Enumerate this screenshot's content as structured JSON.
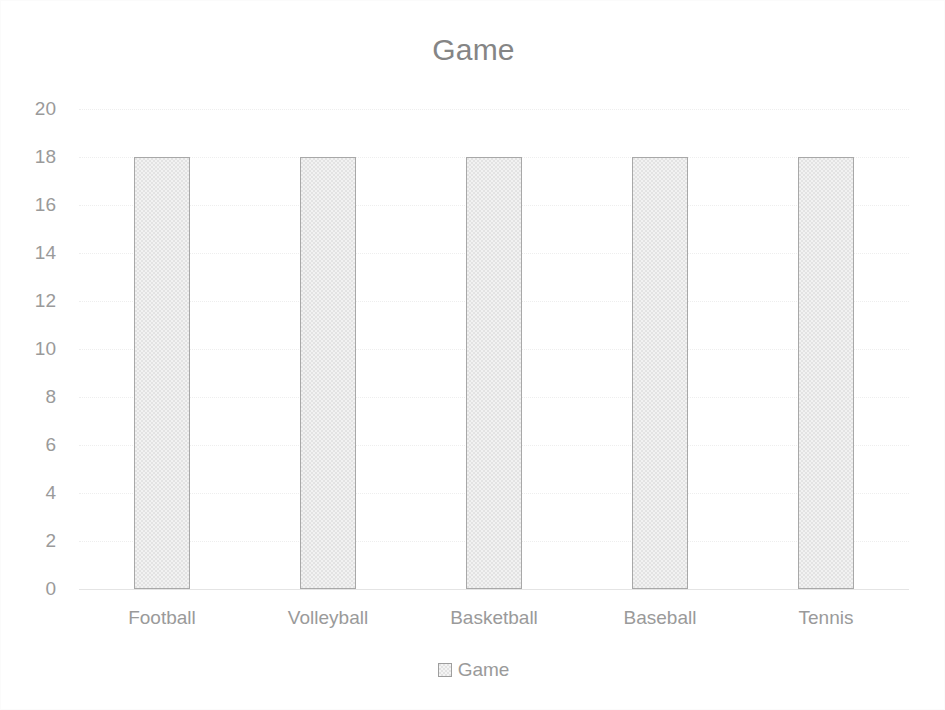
{
  "chart_data": {
    "type": "bar",
    "title": "Game",
    "xlabel": "",
    "ylabel": "",
    "categories": [
      "Football",
      "Volleyball",
      "Basketball",
      "Baseball",
      "Tennis"
    ],
    "series": [
      {
        "name": "Game",
        "values": [
          18,
          18,
          18,
          18,
          18
        ]
      }
    ],
    "values": [
      18,
      18,
      18,
      18,
      18
    ],
    "ylim": [
      0,
      20
    ],
    "ytick_step": 2,
    "ytick_labels": [
      "20",
      "18",
      "16",
      "14",
      "12",
      "10",
      "8",
      "6",
      "4",
      "2",
      "0"
    ],
    "grid": true,
    "grid_axis": "y",
    "legend": {
      "position": "bottom",
      "entries": [
        {
          "label": "Game",
          "swatch_name": "legend-swatch-game"
        }
      ]
    },
    "colors": {
      "bar_fill": "#e3e3e3",
      "bar_border": "#a8a8a8",
      "title_text": "#858585",
      "tick_text": "#9a9a9a",
      "gridline": "#eeeeee",
      "baseline": "#e4e4e4",
      "background": "#ffffff"
    }
  }
}
